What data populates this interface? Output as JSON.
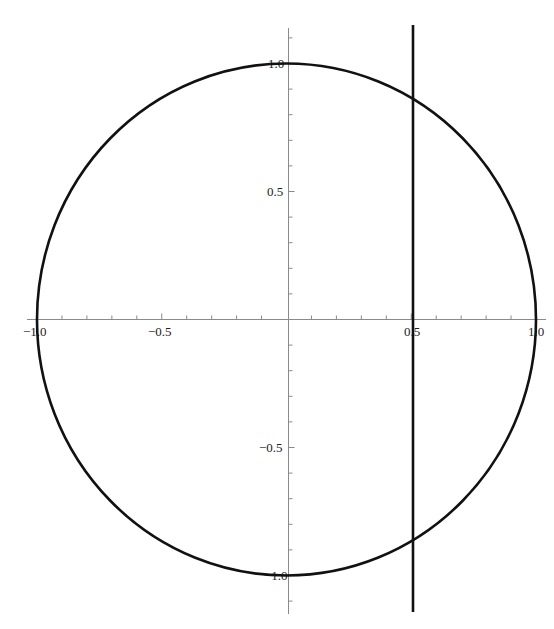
{
  "chart_data": {
    "type": "line",
    "title": "",
    "xlabel": "",
    "ylabel": "",
    "xlim": [
      -1.05,
      1.05
    ],
    "ylim": [
      -1.15,
      1.15
    ],
    "grid": false,
    "legend": null,
    "x_ticks": {
      "major": [
        -1.0,
        -0.5,
        0.5,
        1.0
      ],
      "major_labels": [
        "-1.0",
        "-0.5",
        "0.5",
        "1.0"
      ],
      "minor_step": 0.1
    },
    "y_ticks": {
      "major": [
        1.0,
        0.5,
        -0.5,
        -1.0
      ],
      "major_labels": [
        "1.0",
        "0.5",
        "-0.5",
        "-1.0"
      ],
      "minor_step": 0.1
    },
    "series": [
      {
        "name": "unit circle",
        "equation": "x^2 + y^2 = 1",
        "kind": "circle",
        "center": [
          0,
          0
        ],
        "radius": 1,
        "color": "#111111"
      },
      {
        "name": "vertical line",
        "equation": "x = 0.5",
        "kind": "vline",
        "x": 0.5,
        "y_range": [
          -1.15,
          1.15
        ],
        "color": "#111111"
      }
    ],
    "intersections": [
      [
        0.5,
        0.866
      ],
      [
        0.5,
        -0.866
      ]
    ]
  },
  "labels": {
    "x_neg1": "−1.0",
    "x_neg05": "−0.5",
    "x_05": "0.5",
    "x_1": "1.0",
    "y_1": "1.0",
    "y_05": "0.5",
    "y_neg05": "−0.5",
    "y_neg1": "−1.0"
  },
  "colors": {
    "axis": "#8a8a8a",
    "curve": "#111111",
    "background": "#ffffff"
  }
}
